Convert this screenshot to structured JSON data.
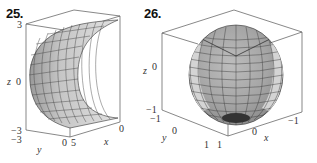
{
  "figures": [
    {
      "number": "25.",
      "surface": "half-cylinder",
      "axes": {
        "z_label": "z",
        "y_label": "y",
        "x_label": "x",
        "z_ticks": [
          "3",
          "0",
          "−3"
        ],
        "y_ticks": [
          "−3",
          "0"
        ],
        "x_ticks": [
          "5",
          "0"
        ]
      }
    },
    {
      "number": "26.",
      "surface": "sphere",
      "axes": {
        "z_label": "z",
        "y_label": "y",
        "x_label": "x",
        "z_ticks": [
          "0",
          "−1"
        ],
        "y_ticks": [
          "−1",
          "0",
          "1"
        ],
        "x_ticks": [
          "1",
          "0",
          "−1"
        ]
      }
    }
  ]
}
